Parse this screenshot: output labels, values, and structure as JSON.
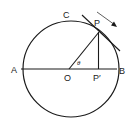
{
  "diagram": {
    "type": "geometry",
    "colors": {
      "stroke": "#1a1a1a",
      "background": "#ffffff"
    },
    "labels": {
      "A": "A",
      "B": "B",
      "C": "C",
      "O": "O",
      "P": "P",
      "P_prime": "P′",
      "theta": "θ"
    },
    "geometry": {
      "center": [
        71,
        69
      ],
      "radius": 48,
      "point_P": [
        99,
        31
      ],
      "point_P_prime": [
        99,
        69
      ],
      "point_A": [
        23,
        69
      ],
      "point_B": [
        119,
        69
      ]
    }
  }
}
